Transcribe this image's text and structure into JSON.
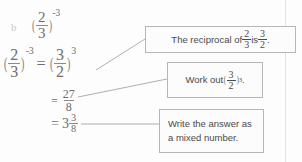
{
  "page": {
    "item_letter": "b",
    "ink_color": "#6d6d6d",
    "box_border_color": "#b6b6b6",
    "box_text_color": "#4a4a4a"
  },
  "heading": {
    "base_num": "2",
    "base_den": "3",
    "exponent": "-3"
  },
  "steps": [
    {
      "id": "step-1",
      "lhs_num": "2",
      "lhs_den": "3",
      "lhs_exp": "-3",
      "equals": "=",
      "rhs_num": "3",
      "rhs_den": "2",
      "rhs_exp": "3"
    },
    {
      "id": "step-2",
      "equals": "=",
      "num": "27",
      "den": "8"
    },
    {
      "id": "step-3",
      "equals": "=",
      "whole": "3",
      "num": "3",
      "den": "8"
    }
  ],
  "callouts": [
    {
      "id": "callout-1",
      "prefix": "The reciprocal of ",
      "frac1_num": "2",
      "frac1_den": "3",
      "middle": " is ",
      "frac2_num": "3",
      "frac2_den": "2",
      "suffix": "."
    },
    {
      "id": "callout-2",
      "prefix": "Work out ",
      "frac_num": "3",
      "frac_den": "2",
      "exponent": "3",
      "suffix": "."
    },
    {
      "id": "callout-3",
      "line1": "Write the answer as",
      "line2": "a mixed number."
    }
  ]
}
